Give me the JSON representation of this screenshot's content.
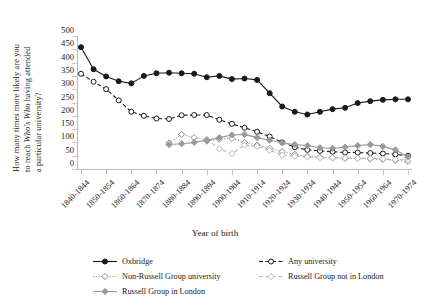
{
  "chart_data": {
    "type": "line",
    "title": "",
    "xlabel": "Year of birth",
    "ylabel_line1": "How many times more likely are you",
    "ylabel_line2_pre": "to reach ",
    "ylabel_line2_ital": "Who's Who",
    "ylabel_line2_post": " having attended",
    "ylabel_line3": "a particular university?",
    "ylim": [
      0,
      500
    ],
    "yticks": [
      0,
      50,
      100,
      150,
      200,
      250,
      300,
      350,
      400,
      450,
      500
    ],
    "grid": false,
    "legend_position": "bottom",
    "categories": [
      "1840-1844",
      "1845-1849",
      "1850-1854",
      "1855-1859",
      "1860-1864",
      "1865-1869",
      "1870-1874",
      "1875-1879",
      "1880-1884",
      "1885-1889",
      "1890-1894",
      "1895-1899",
      "1900-1904",
      "1905-1909",
      "1910-1914",
      "1915-1919",
      "1920-1924",
      "1925-1929",
      "1930-1934",
      "1935-1939",
      "1940-1944",
      "1945-1949",
      "1950-1954",
      "1955-1959",
      "1960-1964",
      "1965-1969",
      "1970-1974"
    ],
    "tick_labels": [
      "1840-1844",
      "1850-1854",
      "1860-1864",
      "1870-1874",
      "1880-1884",
      "1890-1894",
      "1900-1904",
      "1910-1914",
      "1920-1924",
      "1930-1934",
      "1940-1944",
      "1950-1954",
      "1960-1964",
      "1970-1974"
    ],
    "series": [
      {
        "name": "Oxbridge",
        "color": "#1a1a1a",
        "marker": "filled-circle",
        "dash": "solid",
        "values": [
          458,
          375,
          348,
          330,
          322,
          350,
          360,
          362,
          360,
          358,
          345,
          350,
          338,
          340,
          335,
          285,
          235,
          215,
          205,
          215,
          225,
          230,
          248,
          255,
          260,
          262,
          262
        ]
      },
      {
        "name": "Any university",
        "color": "#1a1a1a",
        "marker": "open-circle",
        "dash": "dashed",
        "values": [
          358,
          328,
          300,
          258,
          215,
          200,
          190,
          188,
          202,
          203,
          203,
          185,
          170,
          155,
          140,
          122,
          100,
          82,
          72,
          68,
          65,
          62,
          62,
          60,
          58,
          55,
          50
        ]
      },
      {
        "name": "Non-Russell Group university",
        "color": "#8c8c8c",
        "marker": "open-diamond",
        "dash": "dotted",
        "values": [
          null,
          null,
          null,
          null,
          null,
          null,
          null,
          98,
          130,
          118,
          105,
          112,
          115,
          100,
          90,
          78,
          65,
          55,
          48,
          45,
          42,
          40,
          40,
          38,
          36,
          32,
          28
        ]
      },
      {
        "name": "Russell Group not in London",
        "color": "#b5b5b5",
        "marker": "open-diamond",
        "dash": "dashed",
        "values": [
          null,
          null,
          null,
          null,
          null,
          null,
          null,
          null,
          null,
          null,
          112,
          75,
          58,
          90,
          85,
          70,
          52,
          48,
          45,
          43,
          42,
          42,
          40,
          40,
          38,
          35,
          35
        ]
      },
      {
        "name": "Russell Group in London",
        "color": "#9a9a9a",
        "marker": "filled-diamond",
        "dash": "solid",
        "values": [
          null,
          null,
          null,
          null,
          null,
          null,
          null,
          92,
          95,
          100,
          108,
          118,
          128,
          130,
          118,
          108,
          98,
          92,
          88,
          80,
          78,
          82,
          88,
          92,
          85,
          72,
          45
        ]
      }
    ]
  },
  "legend": {
    "items": [
      {
        "label": "Oxbridge"
      },
      {
        "label": "Any university"
      },
      {
        "label": "Non-Russell Group university"
      },
      {
        "label": "Russell Group not in London"
      },
      {
        "label": "Russell Group in London"
      }
    ]
  }
}
